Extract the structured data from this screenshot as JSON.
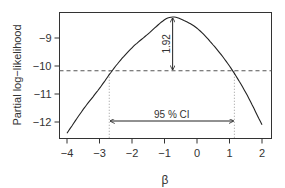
{
  "chart_data": {
    "type": "line",
    "title": "",
    "xlabel": "β",
    "ylabel": "Partial log−likelihood",
    "xlim": [
      -4.25,
      2.3
    ],
    "ylim": [
      -12.55,
      -8.05
    ],
    "x_ticks": [
      -4,
      -3,
      -2,
      -1,
      0,
      1,
      2
    ],
    "x_tick_labels": [
      "−4",
      "−3",
      "−2",
      "−1",
      "0",
      "1",
      "2"
    ],
    "y_ticks": [
      -9,
      -10,
      -11,
      -12
    ],
    "y_tick_labels": [
      "−9",
      "−10",
      "−11",
      "−12"
    ],
    "grid": false,
    "legend": null,
    "series": [
      {
        "name": "profile partial log-likelihood",
        "x": [
          -4.0,
          -3.5,
          -3.0,
          -2.5,
          -2.0,
          -1.5,
          -1.0,
          -0.75,
          -0.5,
          0.0,
          0.5,
          1.0,
          1.5,
          2.0
        ],
        "y": [
          -12.4,
          -11.55,
          -10.8,
          -10.0,
          -9.35,
          -8.85,
          -8.35,
          -8.25,
          -8.32,
          -8.65,
          -9.25,
          -10.0,
          -10.95,
          -12.1
        ]
      }
    ],
    "annotations": {
      "max_loglik": -8.25,
      "beta_hat": -0.75,
      "threshold": -10.17,
      "threshold_label": "1.92",
      "ci_lower": -2.7,
      "ci_upper": 1.15,
      "ci_label": "95 % CI"
    }
  }
}
